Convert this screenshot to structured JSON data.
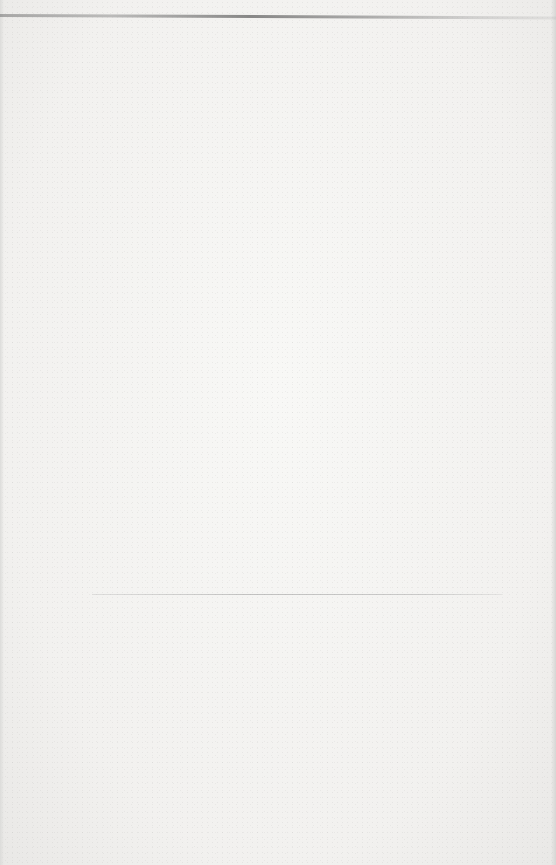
{
  "document": {
    "type": "scanned blank page",
    "text_content": "",
    "elements": [
      {
        "kind": "horizontal-rule",
        "position": "top"
      },
      {
        "kind": "horizontal-rule",
        "position": "lower-middle"
      }
    ],
    "colors": {
      "paper": "#f3f2f0",
      "rule": "#6e6e6e"
    }
  }
}
